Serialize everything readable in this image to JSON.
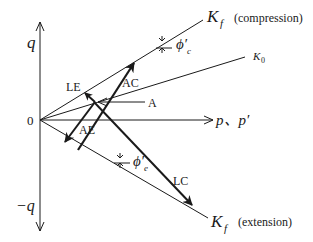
{
  "diagram": {
    "axes": {
      "vertical_positive_label": "q",
      "vertical_negative_label": "−q",
      "horizontal_label": "p、p′",
      "origin_label": "0"
    },
    "lines": {
      "kf_compression": {
        "symbol": "K",
        "subscript": "f",
        "note": "(compression)"
      },
      "k0": {
        "symbol": "K",
        "subscript": "0"
      },
      "kf_extension": {
        "symbol": "K",
        "subscript": "f",
        "note": "(extension)"
      }
    },
    "angles": {
      "compression": {
        "symbol": "ϕ′",
        "subscript": "c"
      },
      "extension": {
        "symbol": "ϕ′",
        "subscript": "e"
      }
    },
    "points": {
      "a": "A"
    },
    "paths": {
      "ac": "AC",
      "le": "LE",
      "ae": "AE",
      "lc": "LC"
    },
    "colors": {
      "line": "#1a1a1a",
      "background": "#ffffff"
    }
  }
}
